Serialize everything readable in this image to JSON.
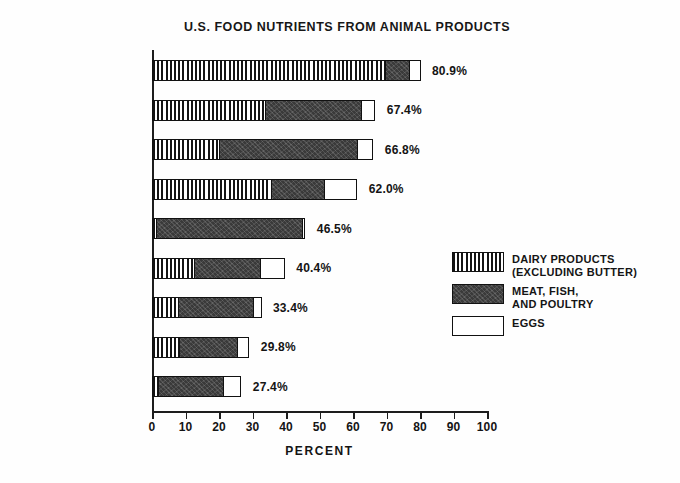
{
  "chart_data": {
    "type": "bar",
    "orientation": "horizontal",
    "stacked": true,
    "title": "U.S. FOOD NUTRIENTS FROM ANIMAL PRODUCTS",
    "xlabel": "PERCENT",
    "ylabel": "",
    "xlim": [
      0,
      100
    ],
    "xticks": [
      0,
      10,
      20,
      30,
      40,
      50,
      60,
      70,
      80,
      90,
      100
    ],
    "xticklabels": [
      "0",
      "10",
      "20",
      "30",
      "40",
      "50",
      "60",
      "70",
      "80",
      "90",
      "100"
    ],
    "grid": false,
    "legend_position": "right-middle",
    "categories": [
      "CALCIUM",
      "PHOSPHORUS",
      "PROTEIN",
      "RIBOFLAVIN",
      "NIACIN",
      "VITAMIN A",
      "THIAMIN",
      "FOOD ENERGY",
      "IRON"
    ],
    "series": [
      {
        "name": "DAIRY PRODUCTS (EXCLUDING BUTTER)",
        "pattern": "vertical-stripes",
        "values": [
          70.0,
          34.0,
          20.5,
          36.0,
          1.5,
          13.0,
          8.0,
          8.5,
          2.0
        ]
      },
      {
        "name": "MEAT, FISH, AND POULTRY",
        "pattern": "dark-solid",
        "values": [
          7.5,
          29.0,
          41.5,
          16.0,
          44.0,
          20.0,
          23.0,
          17.5,
          20.0
        ]
      },
      {
        "name": "EGGS",
        "pattern": "white",
        "values": [
          3.4,
          4.4,
          4.8,
          10.0,
          1.0,
          7.4,
          2.4,
          3.8,
          5.4
        ]
      }
    ],
    "totals": [
      80.9,
      67.4,
      66.8,
      62.0,
      46.5,
      40.4,
      33.4,
      29.8,
      27.4
    ],
    "total_labels": [
      "80.9%",
      "67.4%",
      "66.8%",
      "62.0%",
      "46.5%",
      "40.4%",
      "33.4%",
      "29.8%",
      "27.4%"
    ]
  },
  "legend": {
    "items": [
      {
        "swatch": "dairy-swatch",
        "lines": [
          "DAIRY PRODUCTS",
          "(EXCLUDING BUTTER)"
        ]
      },
      {
        "swatch": "meat-swatch",
        "lines": [
          "MEAT, FISH,",
          "AND POULTRY"
        ]
      },
      {
        "swatch": "eggs-swatch",
        "lines": [
          "EGGS"
        ]
      }
    ]
  },
  "colors": {
    "ink": "#141414",
    "meat_fill": "#3a3a3a",
    "eggs_fill": "#ffffff",
    "background": "#fefefe"
  }
}
